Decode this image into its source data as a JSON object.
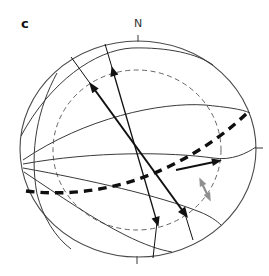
{
  "figure": {
    "panel_label": "c",
    "compass_label": "N"
  },
  "colors": {
    "background": "#ffffff",
    "outer_circle": "#4a4a4a",
    "great_circles": "#3a3a3a",
    "inner_dashed_circle": "#666666",
    "bold_dashed_plane": "#0f0f0f",
    "black_arrows": "#111111",
    "gray_arrow": "#8f8f8f"
  }
}
